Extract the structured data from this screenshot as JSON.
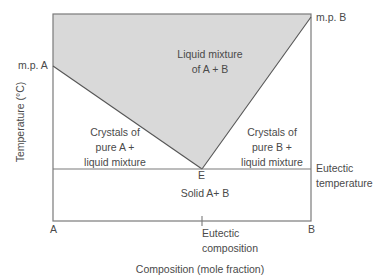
{
  "diagram": {
    "type": "eutectic phase diagram",
    "xlabel": "Composition (mole fraction)",
    "ylabel": "Temperature (°C)",
    "x_axis": {
      "left": "A",
      "right": "B",
      "tick_label": "Eutectic composition"
    },
    "points": {
      "mp_a": "m.p. A",
      "mp_b": "m.p. B",
      "eutectic": "E"
    },
    "lines": {
      "eutectic_temperature": "Eutectic temperature"
    },
    "regions": {
      "liquid": [
        "Liquid mixture",
        "of A + B"
      ],
      "crystals_a": [
        "Crystals of",
        "pure A +",
        "liquid mixture"
      ],
      "crystals_b": [
        "Crystals of",
        "pure B +",
        "liquid mixture"
      ],
      "solid": "Solid A+ B"
    },
    "colors": {
      "liquid_fill": "#d9d9d9",
      "line": "#6b6b6b",
      "text": "#4a4a4a"
    }
  }
}
